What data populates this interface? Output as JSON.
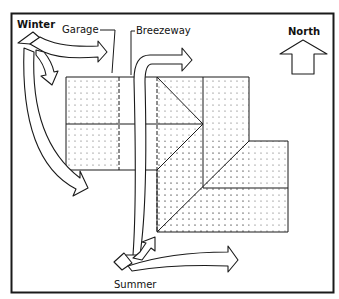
{
  "labels": {
    "winter": "Winter",
    "summer": "Summer",
    "garage": "Garage",
    "breezeway": "Breezeway",
    "north": "North"
  },
  "caption": "",
  "colors": {
    "line": "#1a1a1a",
    "background": "#ffffff",
    "stipple": "#555555"
  },
  "house": {
    "sections": [
      "Garage",
      "Breezeway",
      "Main house",
      "Wing"
    ],
    "shading": "stippled"
  },
  "wind_arrows": {
    "winter": {
      "origin": "northwest",
      "branches": 3
    },
    "summer": {
      "origin": "southwest",
      "branches": 3
    }
  }
}
